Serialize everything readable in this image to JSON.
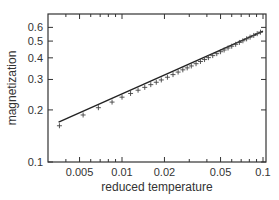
{
  "chart_data": {
    "type": "scatter",
    "title": "",
    "xlabel": "reduced temperature",
    "ylabel": "magnetization",
    "xscale": "log",
    "yscale": "log",
    "xlim": [
      0.003,
      0.105
    ],
    "ylim": [
      0.1,
      0.66
    ],
    "grid": false,
    "legend": null,
    "x_ticks": [
      {
        "value": 0.005,
        "label": "0.005"
      },
      {
        "value": 0.01,
        "label": "0.01"
      },
      {
        "value": 0.02,
        "label": "0.02"
      },
      {
        "value": 0.05,
        "label": "0.05"
      },
      {
        "value": 0.1,
        "label": "0.1"
      }
    ],
    "x_minor_ticks": [
      0.004,
      0.006,
      0.007,
      0.008,
      0.009,
      0.03,
      0.04,
      0.06,
      0.07,
      0.08,
      0.09
    ],
    "y_ticks": [
      {
        "value": 0.1,
        "label": "0.1"
      },
      {
        "value": 0.2,
        "label": "0.2"
      },
      {
        "value": 0.3,
        "label": "0.3"
      },
      {
        "value": 0.4,
        "label": "0.4"
      },
      {
        "value": 0.5,
        "label": "0.5"
      },
      {
        "value": 0.6,
        "label": "0.6"
      }
    ],
    "series": [
      {
        "name": "data",
        "marker": "+",
        "x": [
          0.0036,
          0.0053,
          0.0068,
          0.0085,
          0.01,
          0.0115,
          0.013,
          0.0145,
          0.016,
          0.0175,
          0.019,
          0.021,
          0.023,
          0.025,
          0.027,
          0.029,
          0.031,
          0.0335,
          0.036,
          0.0385,
          0.041,
          0.044,
          0.047,
          0.05,
          0.053,
          0.0565,
          0.06,
          0.064,
          0.068,
          0.072,
          0.0765,
          0.081,
          0.086,
          0.091,
          0.096
        ],
        "y": [
          0.162,
          0.187,
          0.206,
          0.222,
          0.237,
          0.249,
          0.26,
          0.27,
          0.28,
          0.289,
          0.298,
          0.309,
          0.32,
          0.331,
          0.341,
          0.35,
          0.359,
          0.37,
          0.381,
          0.391,
          0.401,
          0.412,
          0.423,
          0.434,
          0.444,
          0.456,
          0.467,
          0.479,
          0.491,
          0.502,
          0.515,
          0.527,
          0.539,
          0.552,
          0.563
        ]
      },
      {
        "name": "fit",
        "type": "line",
        "x": [
          0.00355,
          0.1
        ],
        "y": [
          0.17,
          0.57
        ]
      }
    ]
  },
  "colors": {
    "axis": "#333333",
    "line": "#222222",
    "marker": "#444444",
    "background": "#ffffff"
  }
}
